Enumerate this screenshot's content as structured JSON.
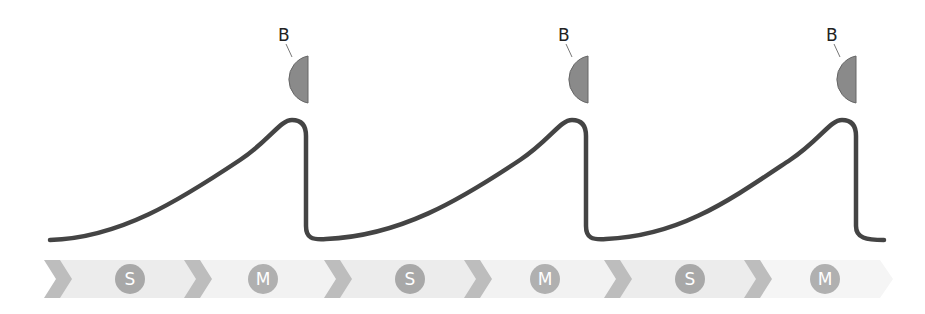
{
  "diagram": {
    "markers": [
      {
        "label": "B",
        "x": 293
      },
      {
        "label": "B",
        "x": 573
      },
      {
        "label": "B",
        "x": 841
      }
    ],
    "phases": [
      {
        "label": "S"
      },
      {
        "label": "M"
      },
      {
        "label": "S"
      },
      {
        "label": "M"
      },
      {
        "label": "S"
      },
      {
        "label": "M"
      }
    ],
    "colors": {
      "curve": "#444444",
      "marker_fill": "#8a8a8a",
      "marker_stroke": "#666666",
      "chevron": "#bdbdbd",
      "band": "#ececec",
      "band_light": "#f3f3f3",
      "phase_circle": "#a8a8a8"
    }
  }
}
